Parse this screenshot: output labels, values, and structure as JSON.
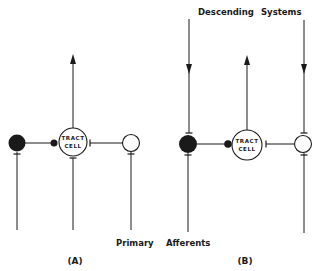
{
  "diagram": {
    "panels": [
      {
        "id": "A",
        "label": "(A)",
        "tract_cell": {
          "line1": "TRACT",
          "line2": "CELL"
        }
      },
      {
        "id": "B",
        "label": "(B)",
        "tract_cell": {
          "line1": "TRACT",
          "line2": "CELL"
        }
      }
    ],
    "labels": {
      "descending_1": "Descending",
      "descending_2": "Systems",
      "primary": "Primary",
      "afferents": "Afferents"
    },
    "colors": {
      "ink": "#1a1a1a",
      "background": "#ffffff"
    }
  }
}
